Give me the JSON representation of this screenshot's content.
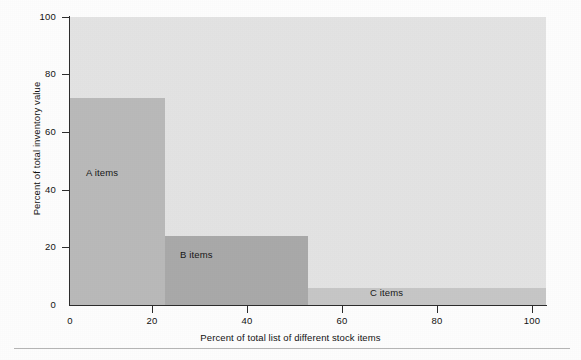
{
  "figure": {
    "background_color": "#fdfdfd",
    "plot_background_color": "#e3e3e3",
    "axis_color": "#2c2c2c",
    "rule_name": "page-separator-rule"
  },
  "chart_data": {
    "type": "bar",
    "title": "",
    "xlabel": "Percent of total list of different stock items",
    "ylabel": "Percent of total inventory value",
    "xlim": [
      0,
      100
    ],
    "ylim": [
      0,
      100
    ],
    "grid": false,
    "legend": "none",
    "x_ticks": [
      0,
      20,
      40,
      60,
      80,
      100
    ],
    "x_tick_labels": [
      "0",
      "20",
      "40",
      "60",
      "80",
      "100"
    ],
    "y_ticks": [
      0,
      20,
      40,
      60,
      80,
      100
    ],
    "y_tick_labels": [
      "0",
      "20",
      "40",
      "60",
      "80",
      "100"
    ],
    "categories": [
      "A items",
      "B items",
      "C items"
    ],
    "values": [
      72,
      24,
      6
    ],
    "bars": [
      {
        "label": "A items",
        "x_start": 0,
        "x_end": 20,
        "value": 72,
        "color": "#b9b9b9"
      },
      {
        "label": "B items",
        "x_start": 20,
        "x_end": 50,
        "value": 24,
        "color": "#a9a9a9"
      },
      {
        "label": "C items",
        "x_start": 50,
        "x_end": 100,
        "value": 6,
        "color": "#c6c6c6"
      }
    ]
  }
}
